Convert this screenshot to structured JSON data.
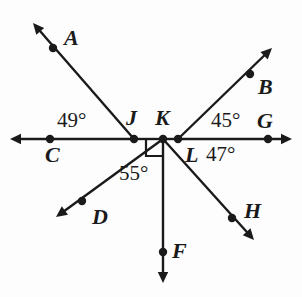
{
  "figure": {
    "type": "geometry-diagram",
    "stroke_color": "#1a1a1a",
    "background_color": "#fdfdfd",
    "width": 302,
    "height": 297
  },
  "points": [
    {
      "id": "A",
      "label": "A",
      "x": 53,
      "y": 48,
      "label_x": 64,
      "label_y": 27
    },
    {
      "id": "B",
      "label": "B",
      "x": 250,
      "y": 74,
      "label_x": 258,
      "label_y": 76
    },
    {
      "id": "C",
      "label": "C",
      "x": 50,
      "y": 139,
      "label_x": 45,
      "label_y": 144
    },
    {
      "id": "D",
      "label": "D",
      "x": 82,
      "y": 201,
      "label_x": 92,
      "label_y": 206
    },
    {
      "id": "F",
      "label": "F",
      "x": 163,
      "y": 252,
      "label_x": 172,
      "label_y": 240
    },
    {
      "id": "G",
      "label": "G",
      "x": 268,
      "y": 139,
      "label_x": 257,
      "label_y": 110
    },
    {
      "id": "H",
      "label": "H",
      "x": 232,
      "y": 218,
      "label_x": 244,
      "label_y": 200
    },
    {
      "id": "J",
      "label": "J",
      "x": 134,
      "y": 139,
      "label_x": 126,
      "label_y": 107
    },
    {
      "id": "K",
      "label": "K",
      "x": 163,
      "y": 139,
      "label_x": 155,
      "label_y": 107
    },
    {
      "id": "L",
      "label": "L",
      "x": 178,
      "y": 139,
      "label_x": 185,
      "label_y": 144
    }
  ],
  "angles": [
    {
      "id": "angle-49",
      "label": "49°",
      "x": 57,
      "y": 110,
      "vertex": "J"
    },
    {
      "id": "angle-45",
      "label": "45°",
      "x": 211,
      "y": 110,
      "vertex": "L"
    },
    {
      "id": "angle-47",
      "label": "47°",
      "x": 206,
      "y": 144,
      "vertex": "L"
    },
    {
      "id": "angle-55",
      "label": "55°",
      "x": 119,
      "y": 163,
      "vertex": "K"
    }
  ],
  "right_angle": {
    "id": "right-angle-K",
    "vertex": "K",
    "between": "ray KJ and ray KF",
    "size": 17
  },
  "rays": [
    {
      "id": "ray-CG-left",
      "name": "ray-to-left-arrow",
      "from": [
        134,
        139
      ],
      "to": [
        10,
        139
      ],
      "arrow": true
    },
    {
      "id": "ray-CG-right",
      "name": "ray-to-right-arrow",
      "from": [
        178,
        139
      ],
      "to": [
        292,
        139
      ],
      "arrow": true
    },
    {
      "id": "seg-JK",
      "name": "segment-J-K",
      "from": [
        134,
        139
      ],
      "to": [
        163,
        139
      ],
      "arrow": false
    },
    {
      "id": "seg-KL",
      "name": "segment-K-L",
      "from": [
        163,
        139
      ],
      "to": [
        178,
        139
      ],
      "arrow": false
    },
    {
      "id": "ray-JA",
      "name": "ray-J-to-A",
      "from": [
        134,
        139
      ],
      "to": [
        33,
        23
      ],
      "arrow": true
    },
    {
      "id": "ray-LB",
      "name": "ray-L-to-B",
      "from": [
        178,
        139
      ],
      "to": [
        272,
        48
      ],
      "arrow": true
    },
    {
      "id": "ray-KD",
      "name": "ray-K-to-D",
      "from": [
        163,
        139
      ],
      "to": [
        56,
        217
      ],
      "arrow": true
    },
    {
      "id": "ray-KF",
      "name": "ray-K-to-F",
      "from": [
        163,
        139
      ],
      "to": [
        163,
        283
      ],
      "arrow": true
    },
    {
      "id": "ray-KH",
      "name": "ray-K-to-H",
      "from": [
        163,
        139
      ],
      "to": [
        254,
        240
      ],
      "arrow": true
    }
  ]
}
